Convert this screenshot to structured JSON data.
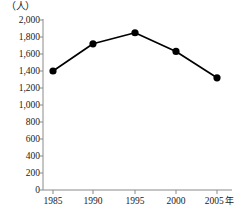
{
  "chart_data": {
    "type": "line",
    "title": "",
    "subtitle": "",
    "xlabel": "年",
    "ylabel": "",
    "unit_label": "（人）",
    "categories": [
      "1985",
      "1990",
      "1995",
      "2000",
      "2005"
    ],
    "x_tick_suffix": "年",
    "x_tick_suffix_index": 4,
    "values": [
      1400,
      1720,
      1850,
      1630,
      1320
    ],
    "series": [
      {
        "name": "",
        "values": [
          1400,
          1720,
          1850,
          1630,
          1320
        ]
      }
    ],
    "ylim": [
      0,
      2000
    ],
    "y_tick_step": 200,
    "y_tick_labels": [
      "2,000",
      "1,800",
      "1,600",
      "1,400",
      "1,200",
      "1,000",
      "800",
      "600",
      "400",
      "200",
      "0"
    ],
    "y_tick_values": [
      2000,
      1800,
      1600,
      1400,
      1200,
      1000,
      800,
      600,
      400,
      200,
      0
    ],
    "grid": false,
    "legend": null,
    "legend_position": "none",
    "annotations": [],
    "marker": "filled-circle",
    "line_color": "#000000",
    "marker_color": "#000000",
    "axis_color": "#8a8a8a",
    "background_color": "#ffffff"
  },
  "geometry": {
    "plot_left": 43,
    "plot_right": 232,
    "plot_top": 20,
    "plot_bottom": 190,
    "x_positions": [
      53,
      93,
      135,
      176,
      217
    ],
    "marker_radius": 3.6,
    "line_width": 1.7,
    "axis_width": 1
  }
}
